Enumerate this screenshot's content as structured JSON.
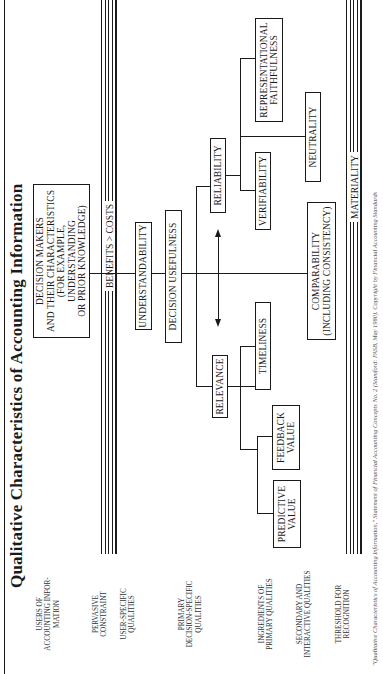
{
  "title": "Qualitative Characteristics of Accounting Information",
  "side_labels": [
    {
      "id": "users",
      "text": "USERS OF\nACCOUNTING INFOR-\nMATION"
    },
    {
      "id": "pervasive",
      "text": "PERVASIVE\nCONSTRAINT"
    },
    {
      "id": "user_specific",
      "text": "USER-SPECIFIC\nQUALITIES"
    },
    {
      "id": "primary",
      "text": "PRIMARY\nDECISION-SPECIFIC\nQUALITIES"
    },
    {
      "id": "ingredients",
      "text": "INGREDIENTS OF\nPRIMARY QUALITIES"
    },
    {
      "id": "secondary",
      "text": "SECONDARY AND\nINTERACTIVE QUALITIES"
    },
    {
      "id": "threshold",
      "text": "THRESHOLD FOR\nRECOGNITION"
    }
  ],
  "boxes": {
    "decision_makers": "DECISION MAKERS\nAND THEIR CHARACTERISTICS\n(FOR EXAMPLE, UNDERSTANDING\nOR PRIOR KNOWLEDGE)",
    "understandability": "UNDERSTANDABILITY",
    "decision_usefulness": "DECISION USEFULNESS",
    "relevance": "RELEVANCE",
    "reliability": "RELIABILITY",
    "timeliness": "TIMELINESS",
    "predictive_value": "PREDICTIVE\nVALUE",
    "feedback_value": "FEEDBACK\nVALUE",
    "verifiability": "VERIFIABILITY",
    "neutrality": "NEUTRALITY",
    "representational_faithfulness": "REPRESENTATIONAL\nFAITHFULNESS",
    "comparability": "COMPARABILITY\n(INCLUDING CONSISTENCY)"
  },
  "bars": {
    "constraint": "BENEFITS > COSTS",
    "threshold": "MATERIALITY"
  },
  "footer": "\"Qualitative Characteristics of Accounting Information,\" Statement of Financial Accounting Concepts No. 2 (Stamford: FASB, May 1980). Copyright by Financial Accounting Standards"
}
